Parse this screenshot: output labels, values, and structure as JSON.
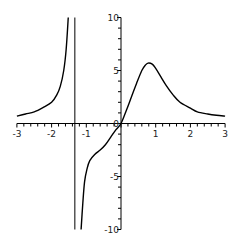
{
  "chart_data": {
    "type": "line",
    "title": "",
    "xlabel": "",
    "ylabel": "",
    "xlim": [
      -3,
      3
    ],
    "ylim": [
      -10,
      10
    ],
    "grid": false,
    "legend": null,
    "x_ticks": [
      -3,
      -2,
      -1,
      0,
      1,
      2,
      3
    ],
    "x_tick_labels": [
      "-3",
      "-2",
      "-1",
      "0",
      "1",
      "2",
      "3"
    ],
    "y_ticks": [
      -10,
      -5,
      0,
      5,
      10
    ],
    "y_tick_labels": [
      "-10",
      "-5",
      "0",
      "5",
      "10"
    ],
    "vertical_asymptote_x": -1.33,
    "series": [
      {
        "name": "left-branch",
        "x": [
          -3,
          -2.75,
          -2.5,
          -2.25,
          -2,
          -1.85,
          -1.75,
          -1.65,
          -1.58,
          -1.52
        ],
        "y": [
          0.7,
          0.9,
          1.1,
          1.5,
          2.0,
          2.7,
          3.5,
          5.0,
          7.0,
          10
        ]
      },
      {
        "name": "right-branch",
        "x": [
          -1.15,
          -1.1,
          -1.05,
          -0.98,
          -0.9,
          -0.75,
          -0.6,
          -0.45,
          -0.3,
          -0.15,
          0,
          0.15,
          0.3,
          0.45,
          0.6,
          0.7,
          0.78,
          0.9,
          1.0,
          1.15,
          1.3,
          1.5,
          1.7,
          2.0,
          2.2,
          2.5,
          2.75,
          3.0
        ],
        "y": [
          -10,
          -7.5,
          -5.5,
          -4.3,
          -3.5,
          -2.9,
          -2.5,
          -2.0,
          -1.3,
          -0.6,
          0,
          1.2,
          2.5,
          3.8,
          5.0,
          5.5,
          5.7,
          5.6,
          5.2,
          4.4,
          3.6,
          2.7,
          2.0,
          1.45,
          1.1,
          0.9,
          0.78,
          0.7
        ]
      }
    ]
  }
}
